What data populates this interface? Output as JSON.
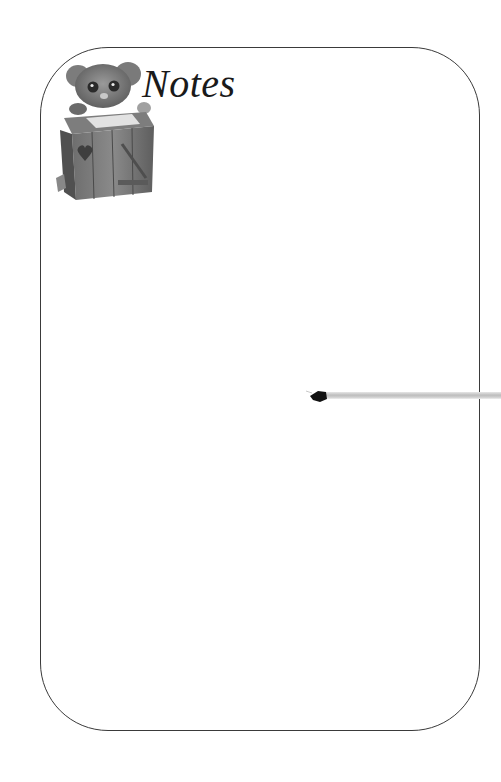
{
  "page": {
    "title": "Notes",
    "figurine": "mouse-at-wooden-desk-figurine",
    "decoration": "pen-pointer",
    "colors": {
      "background": "#ffffff",
      "border": "#3a3a3a",
      "title_text": "#1a1a1a",
      "pen_tip": "#111111",
      "pen_bar": "#bdbdbd"
    }
  }
}
